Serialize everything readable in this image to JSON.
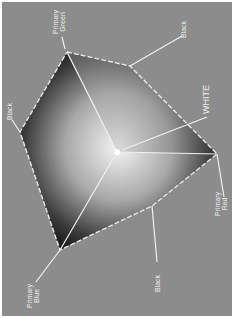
{
  "diagram": {
    "background_color": "#8c8c8c",
    "vertices": [
      {
        "id": "green",
        "label_line1": "Primary",
        "label_line2": "Green"
      },
      {
        "id": "black_tr",
        "label_line1": "Black",
        "label_line2": ""
      },
      {
        "id": "white",
        "label_line1": "WHITE",
        "label_line2": ""
      },
      {
        "id": "red",
        "label_line1": "Primary",
        "label_line2": "Red"
      },
      {
        "id": "black_b",
        "label_line1": "Black",
        "label_line2": ""
      },
      {
        "id": "blue",
        "label_line1": "Primary",
        "label_line2": "Blue"
      },
      {
        "id": "black_l",
        "label_line1": "Black",
        "label_line2": ""
      }
    ],
    "edge_labels": [
      "Green",
      "Red",
      "Blue"
    ]
  }
}
